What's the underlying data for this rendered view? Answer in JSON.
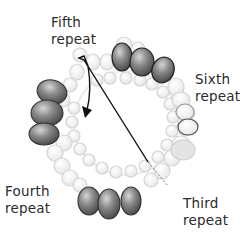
{
  "labels": {
    "fifth": {
      "line1": "Fifth",
      "line2": "repeat"
    },
    "sixth": {
      "line1": "Sixth",
      "line2": "repeat"
    },
    "fourth": {
      "line1": "Fourth",
      "line2": "repeat"
    },
    "third": {
      "line1": "Third",
      "line2": "repeat"
    }
  },
  "colors": {
    "dark_bead": "#6a6a6a",
    "light_bead": "#f2f2f2",
    "bead_outline": "#d0d0d0",
    "chain": "#111111"
  }
}
